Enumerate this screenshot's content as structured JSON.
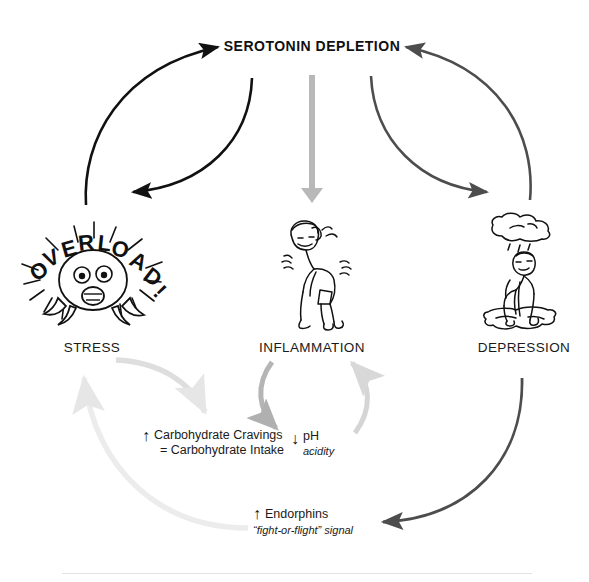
{
  "diagram": {
    "title": "SEROTONIN DEPLETION",
    "nodes": [
      {
        "id": "stress",
        "label": "STRESS",
        "icon": "overload-head-icon",
        "x": 92,
        "y": 347
      },
      {
        "id": "inflammation",
        "label": "INFLAMMATION",
        "icon": "hunched-person-icon",
        "x": 312,
        "y": 347
      },
      {
        "id": "depression",
        "label": "DEPRESSION",
        "icon": "rain-cloud-person-icon",
        "x": 524,
        "y": 347
      }
    ],
    "annotations": {
      "carbohydrate": {
        "line1": "Carbohydrate Cravings",
        "line2": "= Carbohydrate Intake",
        "arrow": "↑"
      },
      "ph": {
        "label": "pH",
        "sub": "acidity",
        "arrow": "↓"
      },
      "endorphins": {
        "label": "Endorphins",
        "sub": "“fight-or-flight” signal",
        "arrow": "↑"
      },
      "ellipsis": "···"
    },
    "overload_text": "OVERLOAD!",
    "colors": {
      "black_arrow": "#111111",
      "dark_gray_arrow": "#4d4d4d",
      "mid_gray_arrow": "#b0b0b0",
      "light_gray_arrow": "#d8d8d8",
      "faint_gray_arrow": "#e6e6e6",
      "text": "#1a1a1a",
      "background": "#ffffff"
    },
    "edges": [
      {
        "id": "stress-to-serotonin",
        "from": "stress",
        "to": "serotonin-depletion",
        "color": "black_arrow"
      },
      {
        "id": "serotonin-to-stress",
        "from": "serotonin-depletion",
        "to": "stress",
        "color": "black_arrow"
      },
      {
        "id": "serotonin-to-inflammation",
        "from": "serotonin-depletion",
        "to": "inflammation",
        "color": "mid_gray_arrow"
      },
      {
        "id": "depression-to-serotonin",
        "from": "depression",
        "to": "serotonin-depletion",
        "color": "dark_gray_arrow"
      },
      {
        "id": "serotonin-to-depression",
        "from": "serotonin-depletion",
        "to": "depression",
        "color": "dark_gray_arrow"
      },
      {
        "id": "stress-to-carbohydrate",
        "from": "stress",
        "to": "carbohydrate",
        "color": "light_gray_arrow"
      },
      {
        "id": "endorphins-to-stress",
        "from": "endorphins",
        "to": "stress",
        "color": "faint_gray_arrow"
      },
      {
        "id": "inflammation-to-ph",
        "from": "inflammation",
        "to": "ph",
        "color": "mid_gray_arrow"
      },
      {
        "id": "ph-to-inflammation",
        "from": "ph",
        "to": "inflammation",
        "color": "light_gray_arrow"
      },
      {
        "id": "depression-to-endorphins",
        "from": "depression",
        "to": "endorphins",
        "color": "dark_gray_arrow"
      }
    ]
  }
}
